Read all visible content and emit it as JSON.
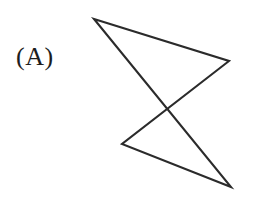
{
  "figure": {
    "label": "(A)",
    "canvas": {
      "width": 254,
      "height": 198,
      "background": "#ffffff"
    },
    "shape": {
      "name": "crossed-quadrilateral",
      "description": "self-intersecting quadrilateral (bowtie / crossed polygon)",
      "stroke_color": "#2b2b2b",
      "stroke_width": 2.1,
      "fill": "none",
      "closed": true,
      "vertex_count": 4,
      "vertices": [
        {
          "id": "top-left-apex",
          "x": 94,
          "y": 19
        },
        {
          "id": "right-apex",
          "x": 229,
          "y": 61
        },
        {
          "id": "left-lower-apex",
          "x": 122,
          "y": 144
        },
        {
          "id": "bottom-right-apex",
          "x": 231,
          "y": 187
        }
      ],
      "points_attr": "94,19 229,61 122,144 231,187",
      "edges": [
        {
          "from": "top-left-apex",
          "to": "right-apex"
        },
        {
          "from": "right-apex",
          "to": "left-lower-apex"
        },
        {
          "from": "left-lower-apex",
          "to": "bottom-right-apex"
        },
        {
          "from": "bottom-right-apex",
          "to": "top-left-apex"
        }
      ],
      "self_intersection": {
        "x": 165,
        "y": 108
      }
    }
  }
}
